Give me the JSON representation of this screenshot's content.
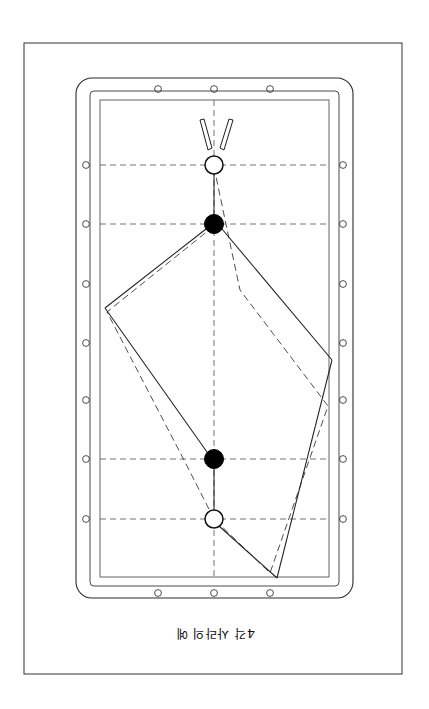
{
  "document": {
    "caption": "4각 사라의 예",
    "caption_rotation_deg": 180,
    "background_color": "#ffffff",
    "ink_color": "#1a1a1a"
  },
  "figure": {
    "page_border": {
      "x": 24,
      "y": 43,
      "width": 378,
      "height": 631
    },
    "table": {
      "cushion_outer": {
        "x": 76,
        "y": 78,
        "width": 277,
        "height": 520,
        "corner_radius": 16
      },
      "cushion_inner": {
        "x": 90,
        "y": 91,
        "width": 249,
        "height": 495
      },
      "playfield": {
        "x": 100,
        "y": 100,
        "width": 229,
        "height": 477
      }
    },
    "diamonds": {
      "label": "diamond-sight-holes",
      "radius": 3.4,
      "top": [
        {
          "x": 158,
          "y": 89
        },
        {
          "x": 214,
          "y": 89
        },
        {
          "x": 270,
          "y": 89
        }
      ],
      "bottom": [
        {
          "x": 158,
          "y": 593
        },
        {
          "x": 214,
          "y": 593
        },
        {
          "x": 270,
          "y": 593
        }
      ],
      "left": [
        {
          "x": 86,
          "y": 165
        },
        {
          "x": 86,
          "y": 224
        },
        {
          "x": 86,
          "y": 284
        },
        {
          "x": 86,
          "y": 343
        },
        {
          "x": 86,
          "y": 400
        },
        {
          "x": 86,
          "y": 459
        },
        {
          "x": 86,
          "y": 519
        }
      ],
      "right": [
        {
          "x": 343,
          "y": 165
        },
        {
          "x": 343,
          "y": 224
        },
        {
          "x": 343,
          "y": 284
        },
        {
          "x": 343,
          "y": 343
        },
        {
          "x": 343,
          "y": 400
        },
        {
          "x": 343,
          "y": 459
        },
        {
          "x": 343,
          "y": 519
        }
      ]
    },
    "guide_lines": {
      "style": "dashed",
      "horizontal_y": [
        165,
        224,
        459,
        519
      ],
      "vertical_x": [
        214
      ],
      "vertical_span": {
        "y1": 100,
        "y2": 577
      },
      "horizontal_span": {
        "x1": 100,
        "x2": 329
      }
    },
    "balls": [
      {
        "name": "cue-ball-top",
        "type": "white",
        "cx": 214,
        "cy": 165,
        "r": 9
      },
      {
        "name": "object-ball-top",
        "type": "black",
        "cx": 214,
        "cy": 224,
        "r": 9.5
      },
      {
        "name": "object-ball-bottom",
        "type": "black",
        "cx": 214,
        "cy": 459,
        "r": 9.5
      },
      {
        "name": "cue-ball-bottom",
        "type": "white",
        "cx": 214,
        "cy": 519,
        "r": 9
      }
    ],
    "cue_strike_marks": [
      {
        "name": "stroke-arrow-left",
        "x1": 202,
        "y1": 121,
        "x2": 209,
        "y2": 150
      },
      {
        "name": "stroke-arrow-right",
        "x1": 231,
        "y1": 121,
        "x2": 221,
        "y2": 150
      }
    ],
    "solid_path": {
      "name": "actual-ball-path",
      "points": [
        {
          "x": 214,
          "y": 165
        },
        {
          "x": 214,
          "y": 224
        },
        {
          "x": 105,
          "y": 308
        },
        {
          "x": 214,
          "y": 459
        },
        {
          "x": 214,
          "y": 519
        },
        {
          "x": 277,
          "y": 578
        },
        {
          "x": 332,
          "y": 360
        },
        {
          "x": 214,
          "y": 224
        }
      ]
    },
    "dashed_path": {
      "name": "theoretical-ball-path",
      "points": [
        {
          "x": 214,
          "y": 165
        },
        {
          "x": 227,
          "y": 229
        },
        {
          "x": 240,
          "y": 290
        },
        {
          "x": 328,
          "y": 406
        },
        {
          "x": 270,
          "y": 573
        },
        {
          "x": 214,
          "y": 519
        },
        {
          "x": 185,
          "y": 462
        },
        {
          "x": 107,
          "y": 312
        },
        {
          "x": 214,
          "y": 224
        }
      ]
    }
  }
}
